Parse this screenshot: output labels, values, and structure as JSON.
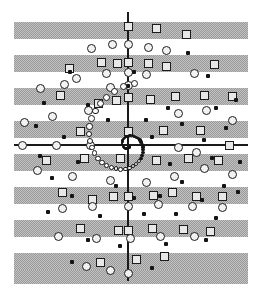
{
  "figure": {
    "width": 262,
    "height": 290,
    "background_color": "#ffffff"
  },
  "colors": {
    "stripe": "#a6a6a6",
    "axis": "#1a1a1a",
    "marker_outline": "#1c1c1c",
    "square_fill": "#e8e8e8",
    "circle_fill": "#f2f2f2",
    "dot_fill": "#141414"
  },
  "axes": {
    "vertical": {
      "x": 128,
      "y_start": 12,
      "y_end": 281,
      "thickness": 2
    },
    "horizontal": {
      "y": 145,
      "x_start": 14,
      "x_end": 248,
      "thickness": 2
    },
    "origin": {
      "x": 128,
      "y": 145
    }
  },
  "stripes": {
    "count": 9,
    "x": 14,
    "width": 234,
    "height": 17,
    "tops": [
      22,
      55,
      88,
      121,
      154,
      187,
      220,
      253,
      270
    ]
  },
  "legend": {
    "marker_types": [
      {
        "name": "square-marker",
        "shape": "square",
        "size": 9
      },
      {
        "name": "circle-marker",
        "shape": "ring",
        "size": 9
      },
      {
        "name": "dot-marker",
        "shape": "dot",
        "size": 4
      }
    ]
  },
  "chart_data": {
    "type": "scatter",
    "xlabel": "",
    "ylabel": "",
    "xlim": [
      14,
      248
    ],
    "ylim": [
      12,
      281
    ],
    "grid": false,
    "legend_position": "none",
    "series": [
      {
        "name": "square-marker",
        "marker": "square",
        "size": 9,
        "points": [
          [
            128,
            26
          ],
          [
            156,
            28
          ],
          [
            186,
            34
          ],
          [
            117,
            63
          ],
          [
            101,
            62
          ],
          [
            128,
            62
          ],
          [
            148,
            63
          ],
          [
            166,
            66
          ],
          [
            214,
            64
          ],
          [
            69,
            68
          ],
          [
            60,
            95
          ],
          [
            128,
            97
          ],
          [
            98,
            103
          ],
          [
            116,
            100
          ],
          [
            150,
            99
          ],
          [
            175,
            96
          ],
          [
            204,
            95
          ],
          [
            232,
            96
          ],
          [
            80,
            131
          ],
          [
            128,
            131
          ],
          [
            163,
            130
          ],
          [
            200,
            130
          ],
          [
            229,
            145
          ],
          [
            46,
            160
          ],
          [
            84,
            158
          ],
          [
            120,
            158
          ],
          [
            156,
            160
          ],
          [
            188,
            158
          ],
          [
            218,
            160
          ],
          [
            113,
            196
          ],
          [
            128,
            196
          ],
          [
            153,
            195
          ],
          [
            172,
            192
          ],
          [
            196,
            196
          ],
          [
            62,
            192
          ],
          [
            92,
            199
          ],
          [
            222,
            196
          ],
          [
            80,
            228
          ],
          [
            118,
            230
          ],
          [
            128,
            230
          ],
          [
            152,
            228
          ],
          [
            183,
            229
          ],
          [
            210,
            231
          ],
          [
            100,
            262
          ],
          [
            136,
            259
          ],
          [
            164,
            256
          ]
        ]
      },
      {
        "name": "circle-marker",
        "marker": "ring",
        "size": 9,
        "points": [
          [
            91,
            48
          ],
          [
            112,
            44
          ],
          [
            128,
            44
          ],
          [
            148,
            47
          ],
          [
            166,
            50
          ],
          [
            76,
            78
          ],
          [
            106,
            73
          ],
          [
            128,
            72
          ],
          [
            146,
            74
          ],
          [
            194,
            73
          ],
          [
            40,
            88
          ],
          [
            64,
            84
          ],
          [
            128,
            85
          ],
          [
            110,
            87
          ],
          [
            24,
            122
          ],
          [
            52,
            116
          ],
          [
            88,
            110
          ],
          [
            178,
            113
          ],
          [
            206,
            110
          ],
          [
            232,
            120
          ],
          [
            22,
            145
          ],
          [
            56,
            145
          ],
          [
            90,
            145
          ],
          [
            178,
            147
          ],
          [
            196,
            152
          ],
          [
            37,
            170
          ],
          [
            72,
            176
          ],
          [
            110,
            180
          ],
          [
            146,
            182
          ],
          [
            174,
            176
          ],
          [
            204,
            168
          ],
          [
            232,
            174
          ],
          [
            62,
            208
          ],
          [
            92,
            206
          ],
          [
            128,
            206
          ],
          [
            158,
            204
          ],
          [
            192,
            206
          ],
          [
            222,
            207
          ],
          [
            58,
            236
          ],
          [
            96,
            238
          ],
          [
            130,
            238
          ],
          [
            160,
            236
          ],
          [
            194,
            236
          ],
          [
            86,
            266
          ],
          [
            110,
            270
          ],
          [
            128,
            273
          ]
        ]
      },
      {
        "name": "dot-marker",
        "marker": "dot",
        "size": 4,
        "points": [
          [
            188,
            53
          ],
          [
            70,
            72
          ],
          [
            134,
            72
          ],
          [
            208,
            76
          ],
          [
            128,
            86
          ],
          [
            44,
            103
          ],
          [
            88,
            105
          ],
          [
            168,
            108
          ],
          [
            216,
            108
          ],
          [
            236,
            100
          ],
          [
            36,
            126
          ],
          [
            108,
            120
          ],
          [
            146,
            120
          ],
          [
            182,
            124
          ],
          [
            226,
            128
          ],
          [
            64,
            137
          ],
          [
            152,
            137
          ],
          [
            204,
            140
          ],
          [
            40,
            156
          ],
          [
            78,
            162
          ],
          [
            170,
            164
          ],
          [
            212,
            158
          ],
          [
            240,
            162
          ],
          [
            52,
            178
          ],
          [
            116,
            186
          ],
          [
            182,
            182
          ],
          [
            224,
            186
          ],
          [
            72,
            196
          ],
          [
            134,
            198
          ],
          [
            160,
            196
          ],
          [
            202,
            200
          ],
          [
            238,
            192
          ],
          [
            48,
            212
          ],
          [
            100,
            216
          ],
          [
            144,
            214
          ],
          [
            176,
            214
          ],
          [
            216,
            218
          ],
          [
            88,
            240
          ],
          [
            120,
            246
          ],
          [
            166,
            244
          ],
          [
            206,
            240
          ],
          [
            72,
            262
          ],
          [
            152,
            268
          ]
        ]
      }
    ],
    "spiral": {
      "name": "logarithmic-spiral",
      "description": "Tight logarithmic spiral of small circular markers winding out from the origin",
      "center": [
        128,
        145
      ],
      "turns": 2.6,
      "a": 2.2,
      "b": 0.3,
      "theta_start": 0.5,
      "theta_end": 17.0,
      "point_count": 96,
      "marker_min_size": 2,
      "marker_max_size": 7
    }
  }
}
